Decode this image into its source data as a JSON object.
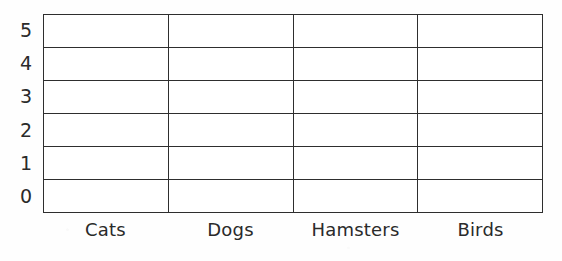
{
  "worksheet": {
    "title": "Pet Tally Bar Graph Grid",
    "background_color": "#ffffff",
    "line_color": "#2e2e2e",
    "text_color": "#2a2a2a"
  },
  "chart_data": {
    "type": "bar",
    "title": "",
    "subtitle": "",
    "xlabel": "",
    "ylabel": "",
    "categories": [
      "Cats",
      "Dogs",
      "Hamsters",
      "Birds"
    ],
    "values": [
      0,
      0,
      0,
      0
    ],
    "series": [
      {
        "name": "Count",
        "values": [
          0,
          0,
          0,
          0
        ]
      }
    ],
    "ylim": [
      0,
      5
    ],
    "y_ticks": [
      "5",
      "4",
      "3",
      "2",
      "1",
      "0"
    ],
    "y_ticks_top_to_bottom": [
      "5",
      "4",
      "3",
      "2",
      "1",
      "0"
    ],
    "grid": true,
    "grid_rows": 6,
    "grid_columns": 4,
    "legend": "none",
    "legend_position": "none",
    "annotations": [],
    "note": "Blank bar-graph worksheet: no bars drawn, all cells empty"
  },
  "y_axis": {
    "ticks": [
      {
        "label": "5"
      },
      {
        "label": "4"
      },
      {
        "label": "3"
      },
      {
        "label": "2"
      },
      {
        "label": "1"
      },
      {
        "label": "0"
      }
    ]
  },
  "x_axis": {
    "labels": [
      {
        "label": "Cats"
      },
      {
        "label": "Dogs"
      },
      {
        "label": "Hamsters"
      },
      {
        "label": "Birds"
      }
    ]
  },
  "grid": {
    "rows": [
      {
        "cells": [
          "",
          "",
          "",
          ""
        ]
      },
      {
        "cells": [
          "",
          "",
          "",
          ""
        ]
      },
      {
        "cells": [
          "",
          "",
          "",
          ""
        ]
      },
      {
        "cells": [
          "",
          "",
          "",
          ""
        ]
      },
      {
        "cells": [
          "",
          "",
          "",
          ""
        ]
      },
      {
        "cells": [
          "",
          "",
          "",
          ""
        ]
      }
    ]
  }
}
